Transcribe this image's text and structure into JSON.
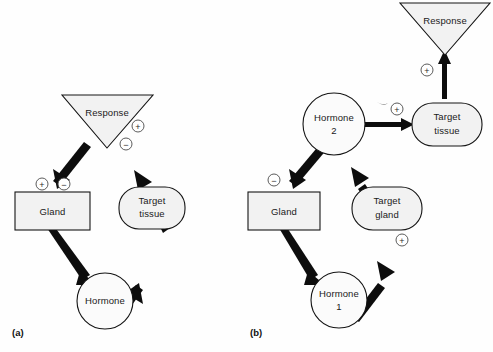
{
  "figure": {
    "background_color": "#fefefe",
    "shape_fill_color": "#f2f2f2",
    "stroke_color": "#141414",
    "arrow_color": "#0d0d0d"
  },
  "panels": [
    {
      "id": "a",
      "label": "(a)",
      "nodes": [
        {
          "key": "response",
          "shape": "triangle-down",
          "line1": "Response",
          "line2": ""
        },
        {
          "key": "gland",
          "shape": "rectangle",
          "line1": "Gland",
          "line2": ""
        },
        {
          "key": "target_tissue",
          "shape": "rounded-rect",
          "line1": "Target",
          "line2": "tissue"
        },
        {
          "key": "hormone",
          "shape": "circle",
          "line1": "Hormone",
          "line2": ""
        }
      ],
      "signs": [
        {
          "key": "gland-plus",
          "symbol": "+"
        },
        {
          "key": "gland-minus",
          "symbol": "−"
        },
        {
          "key": "response-plus",
          "symbol": "+"
        },
        {
          "key": "response-minus",
          "symbol": "−"
        }
      ],
      "edges": [
        {
          "from": "gland",
          "to": "hormone"
        },
        {
          "from": "hormone",
          "to": "target_tissue"
        },
        {
          "from": "target_tissue",
          "to": "response"
        },
        {
          "from": "response",
          "to": "gland"
        }
      ]
    },
    {
      "id": "b",
      "label": "(b)",
      "nodes": [
        {
          "key": "response",
          "shape": "triangle-down",
          "line1": "Response",
          "line2": ""
        },
        {
          "key": "hormone2",
          "shape": "circle",
          "line1": "Hormone",
          "line2": "2"
        },
        {
          "key": "target_tissue",
          "shape": "rounded-rect",
          "line1": "Target",
          "line2": "tissue"
        },
        {
          "key": "gland",
          "shape": "rectangle",
          "line1": "Gland",
          "line2": ""
        },
        {
          "key": "target_gland",
          "shape": "rounded-rect",
          "line1": "Target",
          "line2": "gland"
        },
        {
          "key": "hormone1",
          "shape": "circle",
          "line1": "Hormone",
          "line2": "1"
        }
      ],
      "signs": [
        {
          "key": "response-plus",
          "symbol": "+"
        },
        {
          "key": "tissue-plus",
          "symbol": "+"
        },
        {
          "key": "gland-minus",
          "symbol": "−"
        },
        {
          "key": "target-gland-plus",
          "symbol": "+"
        }
      ],
      "edges": [
        {
          "from": "gland",
          "to": "hormone1"
        },
        {
          "from": "hormone1",
          "to": "target_gland"
        },
        {
          "from": "target_gland",
          "to": "hormone2"
        },
        {
          "from": "hormone2",
          "to": "gland"
        },
        {
          "from": "hormone2",
          "to": "target_tissue"
        },
        {
          "from": "target_tissue",
          "to": "response"
        }
      ]
    }
  ]
}
